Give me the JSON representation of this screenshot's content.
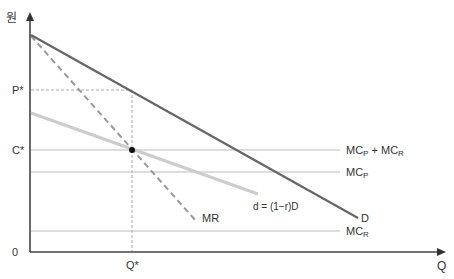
{
  "diagram": {
    "type": "economics-pricing-diagram",
    "axes": {
      "y_label": "원",
      "x_label": "Q",
      "origin_label": "0"
    },
    "y_ticks": {
      "p_star": "P*",
      "c_star": "C*"
    },
    "x_ticks": {
      "q_star": "Q*"
    },
    "curves": {
      "demand": {
        "label": "D",
        "color": "#666666"
      },
      "marginal_revenue": {
        "label": "MR",
        "color": "#999999",
        "style": "dashed"
      },
      "residual_demand": {
        "label": "d = (1−r)D",
        "color": "#cccccc"
      },
      "mc_total": {
        "label_main": "MC",
        "sub1": "P",
        "plus": " + MC",
        "sub2": "R",
        "color": "#bbbbbb"
      },
      "mc_p": {
        "label_main": "MC",
        "sub": "P",
        "color": "#bbbbbb"
      },
      "mc_r": {
        "label_main": "MC",
        "sub": "R",
        "color": "#bbbbbb"
      }
    },
    "colors": {
      "axis": "#444444",
      "guide": "#aaaaaa",
      "dot": "#111111"
    }
  }
}
